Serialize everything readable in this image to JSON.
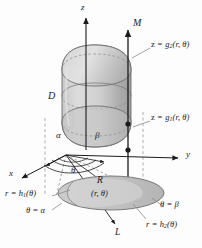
{
  "figure": {
    "kind": "cylindrical-coordinates-solid-diagram",
    "colors": {
      "ink": "#1b1b1b",
      "surface_light": "#d2d2d2",
      "surface_mid": "#bdbdbd",
      "surface_dark": "#a6a6a6",
      "base_fill": "#c6c6c6",
      "base_sub_fill": "#d8d8d8",
      "dash": "#9a9a9a",
      "leader": "#8c8c8c",
      "background": "#fdfdfd"
    },
    "axes": [
      {
        "name": "z",
        "label": "z",
        "x": 86,
        "y": 12,
        "dir": "up"
      },
      {
        "name": "y",
        "label": "y",
        "x": 185,
        "y": 158,
        "dir": "right"
      },
      {
        "name": "x",
        "label": "x",
        "x": 12,
        "y": 176,
        "dir": "down-left"
      }
    ],
    "labels": {
      "solid_M": "M",
      "region_D": "D",
      "top_surface": "z = g₂(r, θ)",
      "top_surface_lead": "z =",
      "top_surface_fn": "g",
      "top_surface_idx": "2",
      "top_surface_arg": "(r, θ)",
      "bottom_surface": "z = g₁(r, θ)",
      "bottom_surface_idx": "1",
      "angle_alpha": "α",
      "angle_beta": "β",
      "angle_theta": "θ",
      "base_region": "R",
      "base_point": "(r, θ)",
      "ray_L": "L",
      "inner_curve_lead": "r =",
      "inner_curve_fn": "h",
      "inner_curve_idx": "1",
      "inner_curve_arg": "(θ)",
      "outer_curve_idx": "2",
      "theta_alpha": "θ = α",
      "theta_beta": "θ = β",
      "eq": "=",
      "theta_sym": "θ",
      "alpha_sym": "α",
      "beta_sym": "β",
      "r_sym": "r",
      "z_sym": "z"
    }
  }
}
